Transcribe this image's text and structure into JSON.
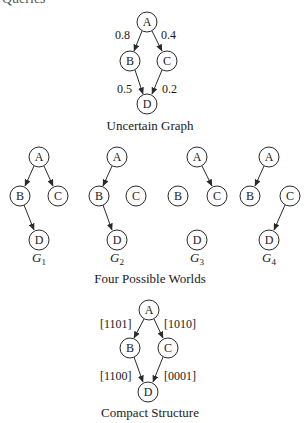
{
  "header_cut_text": "Queries",
  "uncertain_graph": {
    "caption": "Uncertain Graph",
    "nodes": [
      "A",
      "B",
      "C",
      "D"
    ],
    "edges": [
      {
        "from": "A",
        "to": "B",
        "label": "0.8"
      },
      {
        "from": "A",
        "to": "C",
        "label": "0.4"
      },
      {
        "from": "B",
        "to": "D",
        "label": "0.5"
      },
      {
        "from": "C",
        "to": "D",
        "label": "0.2"
      }
    ]
  },
  "possible_worlds": {
    "caption": "Four Possible Worlds",
    "worlds": [
      {
        "name": "G",
        "sub": "1",
        "edges": [
          "A-B",
          "A-C",
          "B-D"
        ]
      },
      {
        "name": "G",
        "sub": "2",
        "edges": [
          "A-B",
          "B-D"
        ]
      },
      {
        "name": "G",
        "sub": "3",
        "edges": [
          "A-C"
        ]
      },
      {
        "name": "G",
        "sub": "4",
        "edges": [
          "A-B",
          "C-D"
        ]
      }
    ]
  },
  "compact_structure": {
    "caption": "Compact Structure",
    "edges": [
      {
        "from": "A",
        "to": "B",
        "label": "[1101]"
      },
      {
        "from": "A",
        "to": "C",
        "label": "[1010]"
      },
      {
        "from": "B",
        "to": "D",
        "label": "[1100]"
      },
      {
        "from": "C",
        "to": "D",
        "label": "[0001]"
      }
    ]
  }
}
